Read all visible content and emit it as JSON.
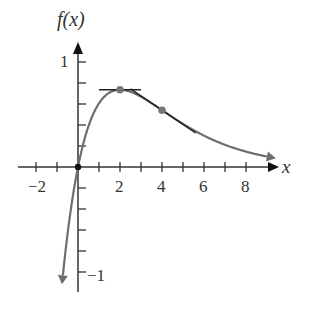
{
  "chart_data": {
    "type": "line",
    "title": "",
    "function": "f(x) = x e^(-x/2)",
    "xlabel": "x",
    "ylabel": "f(x)",
    "xlim": [
      -3,
      9.5
    ],
    "ylim": [
      -1.2,
      1.1
    ],
    "x_ticks": [
      -2,
      -1,
      0,
      1,
      2,
      3,
      4,
      5,
      6,
      7,
      8
    ],
    "x_tick_labels": [
      {
        "value": -2,
        "label": "−2"
      },
      {
        "value": 2,
        "label": "2"
      },
      {
        "value": 4,
        "label": "4"
      },
      {
        "value": 6,
        "label": "6"
      },
      {
        "value": 8,
        "label": "8"
      }
    ],
    "y_ticks": [
      -1,
      -0.8,
      -0.6,
      -0.4,
      -0.2,
      0.2,
      0.4,
      0.6,
      0.8,
      1
    ],
    "y_tick_labels": [
      {
        "value": 1,
        "label": "1"
      },
      {
        "value": -1,
        "label": "−1"
      }
    ],
    "grid": false,
    "series": [
      {
        "name": "f(x)",
        "x": [
          -0.72,
          -0.5,
          -0.25,
          0,
          0.5,
          1,
          1.5,
          2,
          3,
          4,
          5,
          6,
          7,
          8,
          9
        ],
        "values": [
          -1.04,
          -0.64,
          -0.28,
          0,
          0.39,
          0.61,
          0.71,
          0.74,
          0.67,
          0.54,
          0.41,
          0.3,
          0.21,
          0.15,
          0.1
        ],
        "color": "#666666"
      }
    ],
    "points": [
      {
        "x": 0,
        "y": 0
      },
      {
        "x": 2,
        "y": 0.736
      },
      {
        "x": 4,
        "y": 0.541
      }
    ],
    "tangent_lines": [
      {
        "at_x": 2,
        "slope": 0,
        "x_range": [
          1,
          3
        ]
      },
      {
        "at_x": 4,
        "slope": -0.135,
        "x_range": [
          2.5,
          5.6
        ]
      }
    ]
  },
  "labels": {
    "y_axis": "f(x)",
    "x_axis": "x",
    "x_neg2": "−2",
    "x_2": "2",
    "x_4": "4",
    "x_6": "6",
    "x_8": "8",
    "y_1": "1",
    "y_neg1": "−1"
  }
}
